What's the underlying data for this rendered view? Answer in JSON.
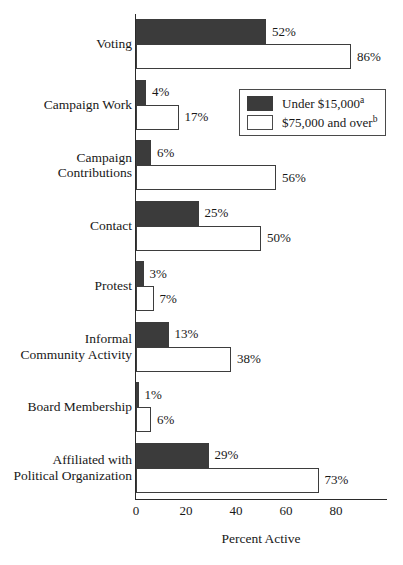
{
  "chart_data": {
    "type": "bar",
    "orientation": "horizontal",
    "title": "",
    "xlabel": "Percent Active",
    "ylabel": "",
    "xlim": [
      0,
      100
    ],
    "xticks": [
      0,
      20,
      40,
      60,
      80
    ],
    "grid": false,
    "legend_position": "upper-right-inset",
    "categories": [
      "Voting",
      "Campaign Work",
      "Campaign Contributions",
      "Contact",
      "Protest",
      "Informal Community Activity",
      "Board Membership",
      "Affiliated with Political Organization"
    ],
    "category_lines": [
      [
        "Voting"
      ],
      [
        "Campaign Work"
      ],
      [
        "Campaign",
        "Contributions"
      ],
      [
        "Contact"
      ],
      [
        "Protest"
      ],
      [
        "Informal",
        "Community Activity"
      ],
      [
        "Board Membership"
      ],
      [
        "Affiliated with",
        "Political Organization"
      ]
    ],
    "series": [
      {
        "name": "Under $15,000",
        "name_superscript": "a",
        "color": "#3b3b3b",
        "values": [
          52,
          4,
          6,
          25,
          3,
          13,
          1,
          29
        ],
        "labels": [
          "52%",
          "4%",
          "6%",
          "25%",
          "3%",
          "13%",
          "1%",
          "29%"
        ]
      },
      {
        "name": "$75,000 and over",
        "name_superscript": "b",
        "color": "#ffffff",
        "values": [
          86,
          17,
          56,
          50,
          7,
          38,
          6,
          73
        ],
        "labels": [
          "86%",
          "17%",
          "56%",
          "50%",
          "7%",
          "38%",
          "6%",
          "73%"
        ]
      }
    ]
  },
  "axis": {
    "tick_labels": [
      "0",
      "20",
      "40",
      "60",
      "80"
    ],
    "x_title": "Percent Active"
  },
  "legend": {
    "entries": [
      {
        "label": "Under $15,000",
        "superscript": "a",
        "swatch": "dark"
      },
      {
        "label": "$75,000 and over",
        "superscript": "b",
        "swatch": "light"
      }
    ]
  },
  "colors": {
    "series_dark": "#3b3b3b",
    "series_light": "#ffffff",
    "axis": "#2a2a2a",
    "text": "#181818",
    "background": "#ffffff"
  }
}
